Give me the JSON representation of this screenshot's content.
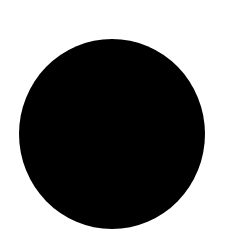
{
  "canvas": {
    "width": 232,
    "height": 236,
    "background_color": "#ffffff"
  },
  "shapes": [
    {
      "type": "circle",
      "fill_color": "#000000",
      "center": [
        112,
        134
      ],
      "radius_x": 93,
      "radius_y": 95
    }
  ]
}
